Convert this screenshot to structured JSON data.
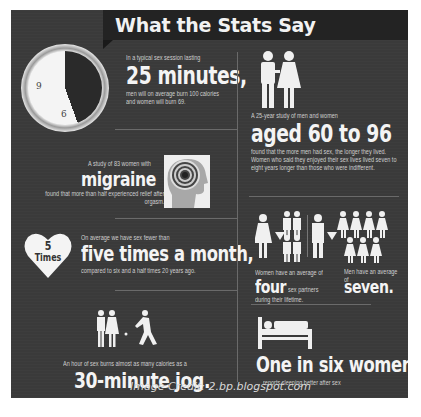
{
  "title": "What the Stats Say",
  "sections": {
    "clock": {
      "intro": "In a typical sex session lasting",
      "headline": "25 minutes,",
      "detail": "men will on average burn 100 calories and women will burn 69.",
      "clock_numbers": [
        "9",
        "6",
        "1"
      ]
    },
    "aged": {
      "intro": "A 25-year study of men and women",
      "headline": "aged 60 to 96",
      "detail": "found that the more men had sex, the longer they lived. Women who said they enjoyed their sex lives lived seven to eight years longer than those who were indifferent."
    },
    "migraine": {
      "intro": "A study of 83 women with",
      "headline": "migraine",
      "detail": "found that more than half experienced relief after orgasm."
    },
    "frequency": {
      "heart_number": "5",
      "heart_label": "Times",
      "intro": "On average we have sex fewer than",
      "headline": "five times a month,",
      "detail": "compared to six and a half times 20 years ago."
    },
    "partners": {
      "women_intro": "Women have an average of",
      "women_headline": "four",
      "women_suffix": "sex partners",
      "women_detail": "during their lifetime.",
      "men_intro": "Men have an average of",
      "men_headline": "seven."
    },
    "jog": {
      "intro": "An hour of sex burns almost as many calories as a",
      "headline": "30-minute jog."
    },
    "sleep": {
      "headline": "One in six women",
      "detail": "reports sleeping better after sex"
    }
  },
  "credit": "Image Credit: 2.bp.blogspot.com",
  "colors": {
    "background": "#3a3a3a",
    "banner": "#232323",
    "text": "#f4f4f4",
    "divider": "#6a6a6a"
  }
}
